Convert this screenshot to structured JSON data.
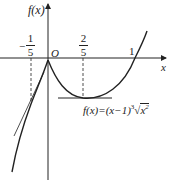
{
  "figure": {
    "y_axis_label": "f(x)",
    "x_axis_label": "x",
    "origin_label": "O",
    "tick_labels": [
      {
        "id": "neg-one-fifth",
        "sign": "−",
        "numerator": "1",
        "denominator": "5",
        "value": -0.2
      },
      {
        "id": "two-fifths",
        "numerator": "2",
        "denominator": "5",
        "value": 0.4
      },
      {
        "id": "one",
        "text": "1",
        "value": 1
      }
    ],
    "function_label": "f(x)=(x−1)",
    "function_exponent": "3",
    "function_radicand": "x",
    "function_radicand_exp": "2",
    "function_expression": "f(x)=(x-1)·∛(x²)",
    "annotations": [
      "dashed vertical line at x=-1/5 with tangent line at that point",
      "dashed vertical line at x=2/5 with horizontal tangent at the local minimum",
      "cusp at origin O"
    ],
    "colors": {
      "stroke": "#222222",
      "background": "#ffffff"
    }
  }
}
